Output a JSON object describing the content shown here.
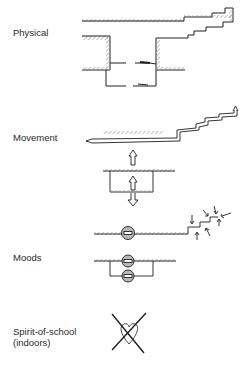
{
  "sections": {
    "physical": {
      "label": "Physical",
      "figure": "building-section-with-stairs"
    },
    "movement": {
      "label": "Movement",
      "figure": "movement-arrows-up-stairs"
    },
    "moods": {
      "label": "Moods",
      "figure": "mood-nodes-and-converging-arrows"
    },
    "spirit": {
      "label_line1": "Spirit-of-school",
      "label_line2": "(indoors)",
      "figure": "crossed-out-heart"
    }
  },
  "colors": {
    "ink": "#1e1e1e",
    "hatch": "#9a9a9a",
    "node_fill": "#b8b8b8",
    "background": "#ffffff"
  }
}
